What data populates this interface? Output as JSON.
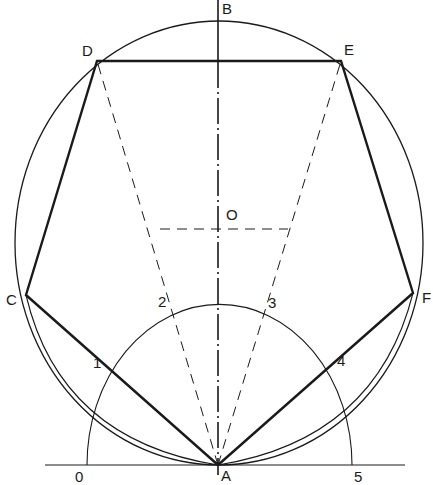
{
  "labels": {
    "A": "A",
    "B": "B",
    "C": "C",
    "D": "D",
    "E": "E",
    "F": "F",
    "O": "O",
    "n0": "0",
    "n1": "1",
    "n2": "2",
    "n3": "3",
    "n4": "4",
    "n5": "5"
  },
  "points": {
    "A": [
      218,
      465
    ],
    "C": [
      26,
      295
    ],
    "D": [
      97,
      61
    ],
    "E": [
      341,
      61
    ],
    "F": [
      413,
      293
    ],
    "O": [
      218,
      229
    ]
  },
  "colors": {
    "ink": "#1a1a1a",
    "background": "#ffffff"
  }
}
